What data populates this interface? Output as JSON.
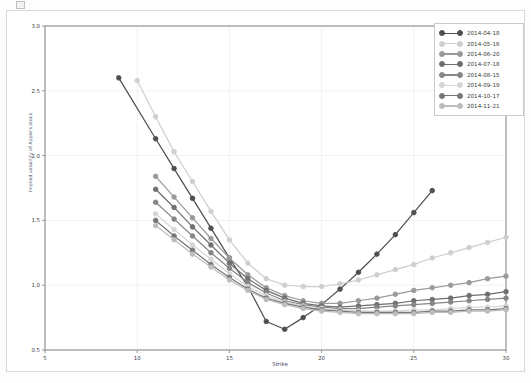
{
  "figure": {
    "xlabel": "Strike",
    "ylabel": "Implied volatility of Apple's stock",
    "legend_position": "upper right"
  },
  "chart_data": {
    "type": "line",
    "title": "",
    "xlabel": "Strike",
    "ylabel": "Implied volatility of Apple's stock",
    "xlim": [
      5,
      30
    ],
    "ylim": [
      0.5,
      3.0
    ],
    "xticks": [
      "5",
      "10",
      "15",
      "20",
      "25",
      "30"
    ],
    "yticks": [
      "0.5",
      "1.0",
      "1.5",
      "2.0",
      "2.5",
      "3.0"
    ],
    "grid": true,
    "legend": [
      "2014-04-18",
      "2014-05-16",
      "2014-06-20",
      "2014-07-18",
      "2014-08-15",
      "2014-09-19",
      "2014-10-17",
      "2014-11-21"
    ],
    "series": [
      {
        "name": "2014-04-18",
        "color": "#4f4f4f",
        "x": [
          9,
          11,
          12,
          13,
          14,
          15,
          16,
          17,
          18,
          19,
          20,
          21,
          22,
          23,
          24,
          25,
          26
        ],
        "y": [
          2.6,
          2.13,
          1.9,
          1.67,
          1.44,
          1.21,
          0.99,
          0.72,
          0.66,
          0.75,
          0.85,
          0.97,
          1.1,
          1.24,
          1.39,
          1.56,
          1.73
        ]
      },
      {
        "name": "2014-05-16",
        "color": "#cfcfcf",
        "x": [
          10,
          11,
          12,
          13,
          14,
          15,
          16,
          17,
          18,
          19,
          20,
          21,
          22,
          23,
          24,
          25,
          26,
          27,
          28,
          29,
          30
        ],
        "y": [
          2.58,
          2.3,
          2.03,
          1.8,
          1.57,
          1.35,
          1.17,
          1.05,
          1.0,
          0.99,
          0.99,
          1.01,
          1.04,
          1.08,
          1.12,
          1.16,
          1.21,
          1.25,
          1.29,
          1.33,
          1.37
        ]
      },
      {
        "name": "2014-06-20",
        "color": "#9a9a9a",
        "x": [
          11,
          12,
          13,
          14,
          15,
          16,
          17,
          18,
          19,
          20,
          21,
          22,
          23,
          24,
          25,
          26,
          27,
          28,
          29,
          30
        ],
        "y": [
          1.84,
          1.68,
          1.52,
          1.36,
          1.21,
          1.08,
          0.98,
          0.92,
          0.88,
          0.86,
          0.86,
          0.88,
          0.9,
          0.93,
          0.96,
          0.98,
          1.0,
          1.02,
          1.05,
          1.07
        ]
      },
      {
        "name": "2014-07-18",
        "color": "#6f6f6f",
        "x": [
          11,
          12,
          13,
          14,
          15,
          16,
          17,
          18,
          19,
          20,
          21,
          22,
          23,
          24,
          25,
          26,
          27,
          28,
          29,
          30
        ],
        "y": [
          1.74,
          1.6,
          1.45,
          1.31,
          1.17,
          1.05,
          0.96,
          0.9,
          0.86,
          0.84,
          0.83,
          0.84,
          0.85,
          0.86,
          0.88,
          0.89,
          0.9,
          0.92,
          0.93,
          0.95
        ]
      },
      {
        "name": "2014-08-15",
        "color": "#868686",
        "x": [
          11,
          12,
          13,
          14,
          15,
          16,
          17,
          18,
          19,
          20,
          21,
          22,
          23,
          24,
          25,
          26,
          27,
          28,
          29,
          30
        ],
        "y": [
          1.64,
          1.51,
          1.38,
          1.25,
          1.13,
          1.02,
          0.94,
          0.88,
          0.85,
          0.83,
          0.82,
          0.82,
          0.83,
          0.84,
          0.85,
          0.86,
          0.87,
          0.88,
          0.89,
          0.9
        ]
      },
      {
        "name": "2014-09-19",
        "color": "#d6d6d6",
        "x": [
          11,
          12,
          13,
          14,
          15,
          16,
          17,
          18,
          19,
          20,
          21,
          22,
          23,
          24,
          25,
          26,
          27,
          28,
          29,
          30
        ],
        "y": [
          1.55,
          1.43,
          1.31,
          1.2,
          1.09,
          0.99,
          0.92,
          0.87,
          0.84,
          0.82,
          0.81,
          0.8,
          0.8,
          0.8,
          0.81,
          0.81,
          0.82,
          0.83,
          0.83,
          0.84
        ]
      },
      {
        "name": "2014-10-17",
        "color": "#777777",
        "x": [
          11,
          12,
          13,
          14,
          15,
          16,
          17,
          18,
          19,
          20,
          21,
          22,
          23,
          24,
          25,
          26,
          27,
          28,
          29,
          30
        ],
        "y": [
          1.5,
          1.38,
          1.27,
          1.16,
          1.06,
          0.97,
          0.9,
          0.86,
          0.83,
          0.81,
          0.8,
          0.79,
          0.79,
          0.79,
          0.79,
          0.8,
          0.8,
          0.81,
          0.81,
          0.82
        ]
      },
      {
        "name": "2014-11-21",
        "color": "#bdbdbd",
        "x": [
          11,
          12,
          13,
          14,
          15,
          16,
          17,
          18,
          19,
          20,
          21,
          22,
          23,
          24,
          25,
          26,
          27,
          28,
          29,
          30
        ],
        "y": [
          1.46,
          1.35,
          1.24,
          1.14,
          1.04,
          0.96,
          0.89,
          0.85,
          0.82,
          0.8,
          0.79,
          0.78,
          0.78,
          0.78,
          0.78,
          0.79,
          0.79,
          0.8,
          0.8,
          0.81
        ]
      }
    ]
  }
}
